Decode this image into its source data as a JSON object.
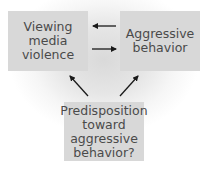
{
  "diagram": {
    "nodes": [
      {
        "id": "viewing",
        "label": "Viewing\nmedia\nviolence"
      },
      {
        "id": "aggression",
        "label": "Aggressive\nbehavior"
      },
      {
        "id": "predisposition",
        "label": "Predisposition\ntoward\naggressive\nbehavior?"
      }
    ],
    "edges": [
      {
        "from": "aggression",
        "to": "viewing"
      },
      {
        "from": "viewing",
        "to": "aggression"
      },
      {
        "from": "predisposition",
        "to": "viewing"
      },
      {
        "from": "predisposition",
        "to": "aggression"
      }
    ],
    "colors": {
      "box_fill": "#d8d8d8",
      "text": "#4a4a4a",
      "arrow": "#1a1a1a"
    }
  }
}
